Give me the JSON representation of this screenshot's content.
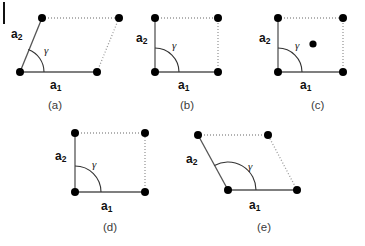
{
  "figure": {
    "canvas": {
      "width": 365,
      "height": 246,
      "background": "#ffffff"
    },
    "style": {
      "solid_edge_color": "#555555",
      "dotted_edge_color": "#999999",
      "point_color": "#000000",
      "point_radius": 4.0,
      "center_point_radius": 3.6,
      "arc_color": "#333333",
      "edge_width": 1.3,
      "dot_dash": "1,2"
    },
    "left_margin_mark": {
      "x": 3,
      "y": 2,
      "width": 2,
      "height": 22,
      "color": "#111111"
    },
    "labels": {
      "a1": "a",
      "a1_sub": "1",
      "a2": "a",
      "a2_sub": "2",
      "gamma": "γ"
    },
    "panels": [
      {
        "id": "a",
        "caption": "(a)",
        "lattice_type": "oblique",
        "gamma_degrees": 70,
        "origin": {
          "x": 20,
          "y": 72
        },
        "vertices": {
          "origin": {
            "x": 20,
            "y": 72
          },
          "a1_end": {
            "x": 97,
            "y": 72
          },
          "a2_end": {
            "x": 42,
            "y": 18
          },
          "opposite": {
            "x": 119,
            "y": 18
          }
        },
        "solid_edges": [
          "origin-a1_end",
          "origin-a2_end"
        ],
        "dotted_edges": [
          "a2_end-opposite",
          "a1_end-opposite"
        ],
        "points": [
          {
            "x": 20,
            "y": 72
          },
          {
            "x": 97,
            "y": 72
          },
          {
            "x": 42,
            "y": 18
          },
          {
            "x": 119,
            "y": 18
          }
        ],
        "center_point": null,
        "arc": {
          "cx": 20,
          "cy": 72,
          "r": 24,
          "start_deg": 0,
          "end_deg": 70
        },
        "a1_label_pos": {
          "x": 50,
          "y": 78
        },
        "a2_label_pos": {
          "x": 11,
          "y": 27
        },
        "gamma_pos": {
          "x": 44,
          "y": 44
        },
        "caption_pos": {
          "x": 48,
          "y": 99
        }
      },
      {
        "id": "b",
        "caption": "(b)",
        "lattice_type": "primitive rectangular",
        "gamma_degrees": 90,
        "origin": {
          "x": 155,
          "y": 72
        },
        "vertices": {
          "origin": {
            "x": 155,
            "y": 72
          },
          "a1_end": {
            "x": 218,
            "y": 72
          },
          "a2_end": {
            "x": 155,
            "y": 18
          },
          "opposite": {
            "x": 218,
            "y": 18
          }
        },
        "solid_edges": [
          "origin-a1_end",
          "origin-a2_end"
        ],
        "dotted_edges": [
          "a2_end-opposite",
          "a1_end-opposite"
        ],
        "points": [
          {
            "x": 155,
            "y": 72
          },
          {
            "x": 218,
            "y": 72
          },
          {
            "x": 155,
            "y": 18
          },
          {
            "x": 218,
            "y": 18
          }
        ],
        "center_point": null,
        "arc": {
          "cx": 155,
          "cy": 72,
          "r": 24,
          "start_deg": 0,
          "end_deg": 90
        },
        "a1_label_pos": {
          "x": 178,
          "y": 78
        },
        "a2_label_pos": {
          "x": 136,
          "y": 31
        },
        "gamma_pos": {
          "x": 172,
          "y": 39
        },
        "caption_pos": {
          "x": 180,
          "y": 99
        }
      },
      {
        "id": "c",
        "caption": "(c)",
        "lattice_type": "centered rectangular",
        "gamma_degrees": 90,
        "origin": {
          "x": 278,
          "y": 72
        },
        "vertices": {
          "origin": {
            "x": 278,
            "y": 72
          },
          "a1_end": {
            "x": 343,
            "y": 72
          },
          "a2_end": {
            "x": 278,
            "y": 18
          },
          "opposite": {
            "x": 343,
            "y": 18
          }
        },
        "solid_edges": [
          "origin-a1_end",
          "origin-a2_end"
        ],
        "dotted_edges": [
          "a2_end-opposite",
          "a1_end-opposite"
        ],
        "points": [
          {
            "x": 278,
            "y": 72
          },
          {
            "x": 343,
            "y": 72
          },
          {
            "x": 278,
            "y": 18
          },
          {
            "x": 343,
            "y": 18
          }
        ],
        "center_point": {
          "x": 313,
          "y": 44
        },
        "arc": {
          "cx": 278,
          "cy": 72,
          "r": 24,
          "start_deg": 0,
          "end_deg": 90
        },
        "a1_label_pos": {
          "x": 300,
          "y": 78
        },
        "a2_label_pos": {
          "x": 259,
          "y": 31
        },
        "gamma_pos": {
          "x": 295,
          "y": 39
        },
        "caption_pos": {
          "x": 311,
          "y": 99
        }
      },
      {
        "id": "d",
        "caption": "(d)",
        "lattice_type": "square",
        "gamma_degrees": 90,
        "origin": {
          "x": 75,
          "y": 192
        },
        "vertices": {
          "origin": {
            "x": 75,
            "y": 192
          },
          "a1_end": {
            "x": 145,
            "y": 192
          },
          "a2_end": {
            "x": 75,
            "y": 133
          },
          "opposite": {
            "x": 145,
            "y": 133
          }
        },
        "solid_edges": [
          "origin-a1_end",
          "origin-a2_end"
        ],
        "dotted_edges": [
          "a2_end-opposite",
          "a1_end-opposite"
        ],
        "points": [
          {
            "x": 75,
            "y": 192
          },
          {
            "x": 145,
            "y": 192
          },
          {
            "x": 75,
            "y": 133
          },
          {
            "x": 145,
            "y": 133
          }
        ],
        "center_point": null,
        "arc": {
          "cx": 75,
          "cy": 192,
          "r": 26,
          "start_deg": 0,
          "end_deg": 90
        },
        "a1_label_pos": {
          "x": 101,
          "y": 199
        },
        "a2_label_pos": {
          "x": 55,
          "y": 149
        },
        "gamma_pos": {
          "x": 92,
          "y": 158
        },
        "caption_pos": {
          "x": 103,
          "y": 221
        }
      },
      {
        "id": "e",
        "caption": "(e)",
        "lattice_type": "hexagonal",
        "gamma_degrees": 120,
        "origin": {
          "x": 228,
          "y": 190
        },
        "vertices": {
          "origin": {
            "x": 228,
            "y": 190
          },
          "a1_end": {
            "x": 297,
            "y": 190
          },
          "a2_end": {
            "x": 198,
            "y": 135
          },
          "opposite": {
            "x": 268,
            "y": 135
          }
        },
        "solid_edges": [
          "origin-a1_end",
          "origin-a2_end"
        ],
        "dotted_edges": [
          "a2_end-opposite",
          "a1_end-opposite"
        ],
        "points": [
          {
            "x": 228,
            "y": 190
          },
          {
            "x": 297,
            "y": 190
          },
          {
            "x": 198,
            "y": 135
          },
          {
            "x": 268,
            "y": 135
          }
        ],
        "center_point": null,
        "arc": {
          "cx": 228,
          "cy": 190,
          "r": 28,
          "start_deg": 0,
          "end_deg": 119
        },
        "a1_label_pos": {
          "x": 249,
          "y": 198
        },
        "a2_label_pos": {
          "x": 186,
          "y": 152
        },
        "gamma_pos": {
          "x": 248,
          "y": 160
        },
        "caption_pos": {
          "x": 257,
          "y": 221
        }
      }
    ]
  }
}
